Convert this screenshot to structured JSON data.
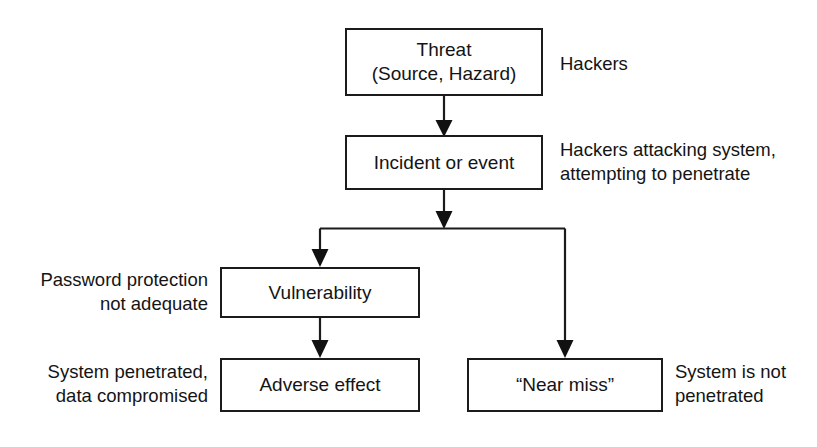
{
  "diagram": {
    "background_color": "#ffffff",
    "line_color": "#1b1b1b",
    "text_color": "#141414",
    "nodes": [
      {
        "id": "threat",
        "lines": [
          "Threat",
          "(Source, Hazard)"
        ]
      },
      {
        "id": "incident",
        "lines": [
          "Incident or event"
        ]
      },
      {
        "id": "vulnerability",
        "lines": [
          "Vulnerability"
        ]
      },
      {
        "id": "adverse-effect",
        "lines": [
          "Adverse effect"
        ]
      },
      {
        "id": "near-miss",
        "lines": [
          "“Near miss”"
        ]
      }
    ],
    "annotations": [
      {
        "id": "threat-note",
        "side": "right",
        "lines": [
          "Hackers"
        ]
      },
      {
        "id": "incident-note",
        "side": "right",
        "lines": [
          "Hackers attacking system,",
          "attempting to penetrate"
        ]
      },
      {
        "id": "vulnerability-note",
        "side": "left",
        "lines": [
          "Password protection",
          "not adequate"
        ]
      },
      {
        "id": "adverse-effect-note",
        "side": "left",
        "lines": [
          "System penetrated,",
          "data compromised"
        ]
      },
      {
        "id": "near-miss-note",
        "side": "right",
        "lines": [
          "System is not",
          "penetrated"
        ]
      }
    ],
    "edges": [
      {
        "id": "threat-to-incident",
        "from": "threat",
        "to": "incident",
        "style": "straight-arrow"
      },
      {
        "id": "incident-to-split",
        "from": "incident",
        "to": "branch-bus",
        "style": "straight-arrow"
      },
      {
        "id": "split-to-vulnerability",
        "from": "branch-bus",
        "to": "vulnerability",
        "style": "elbow-arrow"
      },
      {
        "id": "split-to-near-miss",
        "from": "branch-bus",
        "to": "near-miss",
        "style": "elbow-arrow"
      },
      {
        "id": "vulnerability-to-adverse-effect",
        "from": "vulnerability",
        "to": "adverse-effect",
        "style": "straight-arrow"
      }
    ]
  }
}
